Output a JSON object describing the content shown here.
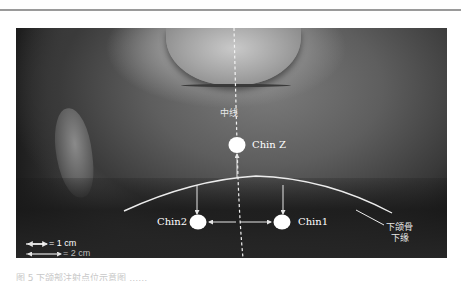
{
  "figure": {
    "labels": {
      "midline": "中线",
      "chin_z": "Chin Z",
      "chin_1": "Chin1",
      "chin_2": "Chin2",
      "mandible_line": [
        "下颌骨",
        "下缘"
      ]
    },
    "legend": [
      {
        "arrow": "short",
        "text": "= 1 cm"
      },
      {
        "arrow": "long",
        "text": "= 2 cm"
      }
    ],
    "colors": {
      "points": "#ffffff",
      "lines": "#e6e6e6",
      "background": "#2a2a2a"
    }
  },
  "caption": {
    "text": "图 5  下颌部注射点位示意图 ……"
  }
}
